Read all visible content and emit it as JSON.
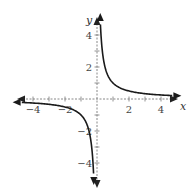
{
  "chart_data": {
    "type": "line",
    "title": "",
    "function": "y = 1/x",
    "xlabel": "x",
    "ylabel": "y",
    "xlim": [
      -5,
      5
    ],
    "ylim": [
      -5,
      5
    ],
    "x_ticks": [
      -4,
      -3,
      -2,
      -1,
      1,
      2,
      3,
      4
    ],
    "x_tick_labels": [
      "-4",
      "-2",
      "2",
      "4"
    ],
    "y_ticks": [
      -4,
      -3,
      -2,
      -1,
      1,
      2,
      3,
      4
    ],
    "y_tick_labels": [
      "4",
      "2",
      "-2",
      "-4"
    ],
    "grid": false,
    "axes_style": "dashed",
    "series": [
      {
        "name": "right branch",
        "x": [
          0.2,
          0.25,
          0.5,
          1,
          2,
          3,
          4,
          5
        ],
        "y": [
          5,
          4,
          2,
          1,
          0.5,
          0.333,
          0.25,
          0.2
        ]
      },
      {
        "name": "left branch",
        "x": [
          -5,
          -4,
          -3,
          -2,
          -1,
          -0.5,
          -0.25,
          -0.2
        ],
        "y": [
          -0.2,
          -0.25,
          -0.333,
          -0.5,
          -1,
          -2,
          -4,
          -5
        ]
      }
    ],
    "colors": {
      "curve": "#1a1a1a",
      "axis": "#888888",
      "text": "#444444"
    }
  },
  "labels": {
    "x_axis": "x",
    "y_axis": "y",
    "x_ticks": [
      {
        "value": -4,
        "text": "−4"
      },
      {
        "value": -2,
        "text": "−2"
      },
      {
        "value": 2,
        "text": "2"
      },
      {
        "value": 4,
        "text": "4"
      }
    ],
    "y_ticks": [
      {
        "value": 4,
        "text": "4"
      },
      {
        "value": 2,
        "text": "2"
      },
      {
        "value": -2,
        "text": "−2"
      },
      {
        "value": -4,
        "text": "−4"
      }
    ]
  }
}
